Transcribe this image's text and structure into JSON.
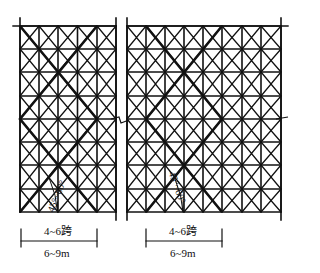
{
  "diagram": {
    "title": "",
    "stroke_color": "#111111",
    "panels": [
      {
        "id": "left",
        "x_lines": [
          20,
          39,
          58,
          77.5,
          97,
          116
        ],
        "y_lines": [
          26,
          49,
          72,
          96,
          119,
          142,
          165,
          189,
          212
        ],
        "post_left": {
          "x": 20,
          "y1": 18,
          "y2": 212
        },
        "post_right": {
          "x": 116,
          "y1": 18,
          "y2": 220
        },
        "top_ledger": {
          "x1": 13,
          "x2": 116,
          "y": 26
        },
        "brace": {
          "left_x": 20,
          "right_x": 97,
          "cross_x": 58.5
        },
        "span_label": "4~6跨",
        "length_label": "6~9m",
        "angle_label": "45°~60°",
        "dim": {
          "x1": 21,
          "x2": 97,
          "y": 241
        }
      },
      {
        "id": "right",
        "x_lines": [
          127,
          146,
          165,
          184,
          203,
          222,
          242,
          261,
          281
        ],
        "y_lines": [
          26,
          49,
          72,
          96,
          119,
          142,
          165,
          189,
          212
        ],
        "post_left": {
          "x": 127,
          "y1": 18,
          "y2": 220
        },
        "post_right": {
          "x": 281,
          "y1": 18,
          "y2": 220
        },
        "top_ledger": {
          "x1": 127,
          "x2": 288,
          "y": 26
        },
        "brace": {
          "left_x": 146,
          "right_x": 222,
          "cross_x": 184
        },
        "span_label": "4~6跨",
        "length_label": "6~9m",
        "angle_label": "45°~60°",
        "dim": {
          "x1": 146,
          "x2": 222,
          "y": 241
        }
      }
    ]
  }
}
